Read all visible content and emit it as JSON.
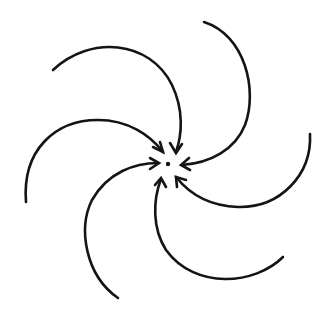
{
  "diagram": {
    "arrow_count": 6,
    "direction": "inward",
    "rotation": "counter-clockwise spiral",
    "colors": {
      "stroke": "#141414",
      "background": "#ffffff"
    },
    "labels": []
  }
}
